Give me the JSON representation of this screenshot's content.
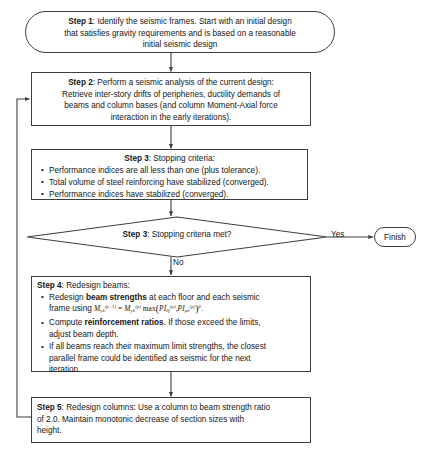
{
  "diagram": {
    "type": "flowchart",
    "orientation": "top-to-bottom",
    "colors": {
      "stroke": "#3d3d3d",
      "text": "#161616",
      "background": "#ffffff"
    }
  },
  "nodes": {
    "step1": {
      "shape": "rounded-rectangle",
      "label_bold": "Step 1",
      "line1_rest": ": Identify the seismic frames. Start with an initial design",
      "line2": "that satisfies gravity requirements and is based on a reasonable",
      "line3": "initial seismic design"
    },
    "step2": {
      "shape": "rectangle",
      "label_bold": "Step 2",
      "line1_rest": ": Perform a seismic analysis of the current design:",
      "line2": "Retrieve inter-story drifts of peripheries, ductility demands of",
      "line3": "beams and column bases (and column Moment-Axial force",
      "line4": "interaction in the early iterations)."
    },
    "step3": {
      "shape": "rectangle",
      "label_bold": "Step 3",
      "title_rest": ": Stopping criteria:",
      "bullets": [
        "Performance indices are all less than one (plus tolerance).",
        "Total volume of steel reinforcing have stabilized (converged).",
        "Performance indices have stabilized (converged)."
      ]
    },
    "decision": {
      "shape": "diamond",
      "label_bold": "Step 3",
      "label_rest": ": Stopping criteria met?"
    },
    "finish": {
      "shape": "rounded-rectangle",
      "label": "Finish"
    },
    "step4": {
      "shape": "rectangle",
      "label_bold": "Step 4",
      "title_rest": ": Redesign beams:",
      "bullet1_pre": "Redesign ",
      "bullet1_bold": "beam strengths",
      "bullet1_post": " at each floor and each seismic",
      "bullet1_line2_pre": "frame using ",
      "bullet1_formula_plain": "M_yb^(p+1) = M_yb^(p) max( PI_thetaj^(p) , PI_mub^(p) )^beta .",
      "bullet2_pre": "Compute ",
      "bullet2_bold": "reinforcement ratios",
      "bullet2_post": ". If those exceed the limits,",
      "bullet2_line2": "adjust beam depth.",
      "bullet3_line1": "If all beams reach their maximum limit strengths, the closest",
      "bullet3_line2": "parallel frame could be identified as seismic for the next",
      "bullet3_line3": "iteration."
    },
    "step5": {
      "shape": "rectangle",
      "label_bold": "Step 5",
      "line1_rest": ": Redesign columns: Use a column to beam strength ratio",
      "line2": "of 2.0. Maintain monotonic decrease of section sizes with",
      "line3": "height."
    }
  },
  "edges": {
    "yes_label": "Yes",
    "no_label": "No",
    "feedback": "loop from Step 5 back to Step 2"
  }
}
